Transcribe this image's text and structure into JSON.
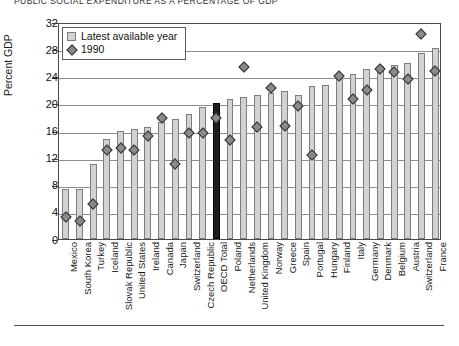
{
  "chart_data": {
    "type": "bar",
    "title": "PUBLIC SOCIAL EXPENDITURE AS A PERCENTAGE OF GDP",
    "xlabel": "",
    "ylabel": "Percent GDP",
    "ylim": [
      0,
      32
    ],
    "ytick_step": 4,
    "yticks": [
      32,
      28,
      24,
      20,
      16,
      12,
      8,
      4,
      0
    ],
    "grid": true,
    "legend_position": "top-left",
    "legend": [
      {
        "label": "Latest available year",
        "marker": "bar-swatch",
        "color": "#d2d2d2"
      },
      {
        "label": "1990",
        "marker": "diamond",
        "color": "#8a8a8a"
      }
    ],
    "categories": [
      "Mexico",
      "South Korea",
      "Turkey",
      "Iceland",
      "Slovak Republic",
      "United States",
      "Ireland",
      "Canada",
      "Japan",
      "Switzerland",
      "Czech Republic",
      "OECD Total",
      "Poland",
      "Netherlands",
      "United Kingdom",
      "Norway",
      "Greece",
      "Spain",
      "Portugal",
      "Hungary",
      "Finland",
      "Italy",
      "Germany",
      "Denmark",
      "Belgium",
      "Austria",
      "Switzerland",
      "France"
    ],
    "highlight_category": "OECD Total",
    "highlight_color": "#1d1d1d",
    "series": [
      {
        "name": "Latest available year",
        "values": [
          7.4,
          7.4,
          11.1,
          14.8,
          16.0,
          16.2,
          16.5,
          17.3,
          17.7,
          18.5,
          19.4,
          20.0,
          20.7,
          20.9,
          21.3,
          21.6,
          21.9,
          21.3,
          22.5,
          22.7,
          24.1,
          24.4,
          25.0,
          25.5,
          25.7,
          25.9,
          27.4,
          28.1
        ],
        "color": "#d2d2d2"
      },
      {
        "name": "1990",
        "values": [
          3.5,
          3.0,
          5.4,
          13.4,
          13.7,
          13.4,
          15.5,
          18.1,
          11.3,
          16.0,
          16.0,
          18.1,
          14.9,
          25.6,
          16.8,
          22.5,
          16.9,
          19.9,
          12.7,
          null,
          24.4,
          21.0,
          22.3,
          25.3,
          24.9,
          23.9,
          30.5,
          25.1
        ],
        "color": "#8a8a8a"
      }
    ]
  }
}
